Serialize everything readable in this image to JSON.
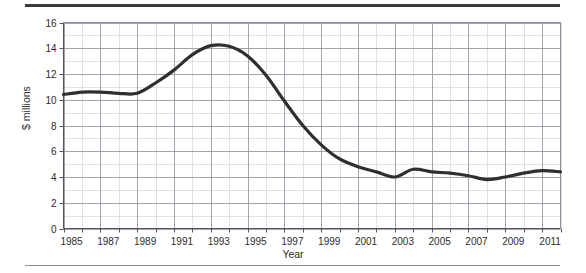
{
  "figure": {
    "top_rule": "horizontal-rule",
    "bottom_rule": "horizontal-rule"
  },
  "chart_data": {
    "type": "line",
    "title": "",
    "subtitle": "",
    "xlabel": "Year",
    "ylabel": "$ millions",
    "xlim": [
      1985,
      2012
    ],
    "ylim": [
      0,
      16
    ],
    "y_major_step": 2,
    "y_minor_step": 1,
    "x_major_step": 1,
    "x_tick_label_step": 2,
    "grid": true,
    "grid_color": "#9a9aa8",
    "minor_grid_color": "#d2d2dc",
    "legend": null,
    "legend_position": "none",
    "line_color": "#2f2f2f",
    "line_width": 3.2,
    "yticks": [
      0,
      2,
      4,
      6,
      8,
      10,
      12,
      14,
      16
    ],
    "ytick_labels": [
      "0",
      "2",
      "4",
      "6",
      "8",
      "10",
      "12",
      "14",
      "16"
    ],
    "xticks": [
      1985,
      1987,
      1989,
      1991,
      1993,
      1995,
      1997,
      1999,
      2001,
      2003,
      2005,
      2007,
      2009,
      2011
    ],
    "xtick_labels": [
      "1985",
      "1987",
      "1989",
      "1991",
      "1993",
      "1995",
      "1997",
      "1999",
      "2001",
      "2003",
      "2005",
      "2007",
      "2009",
      "2011"
    ],
    "x": [
      1985,
      1986,
      1987,
      1988,
      1989,
      1990,
      1991,
      1992,
      1993,
      1994,
      1995,
      1996,
      1997,
      1998,
      1999,
      2000,
      2001,
      2002,
      2003,
      2004,
      2005,
      2006,
      2007,
      2008,
      2009,
      2010,
      2011,
      2012
    ],
    "values": [
      10.4,
      10.6,
      10.6,
      10.5,
      10.5,
      11.3,
      12.3,
      13.5,
      14.2,
      14.15,
      13.4,
      11.9,
      9.9,
      8.0,
      6.5,
      5.4,
      4.8,
      4.4,
      4.0,
      4.6,
      4.4,
      4.3,
      4.1,
      3.8,
      4.0,
      4.3,
      4.5,
      4.4
    ],
    "series": [
      {
        "name": "$ millions",
        "values": [
          10.4,
          10.6,
          10.6,
          10.5,
          10.5,
          11.3,
          12.3,
          13.5,
          14.2,
          14.15,
          13.4,
          11.9,
          9.9,
          8.0,
          6.5,
          5.4,
          4.8,
          4.4,
          4.0,
          4.6,
          4.4,
          4.3,
          4.1,
          3.8,
          4.0,
          4.3,
          4.5,
          4.4
        ]
      }
    ],
    "annotations": []
  }
}
